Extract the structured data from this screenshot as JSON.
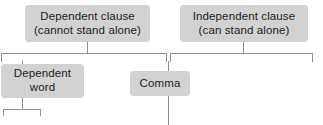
{
  "diagram": {
    "background_color": "#ffffff",
    "box_fill_color": "#d2d2d2",
    "text_color": "#1c1c1c",
    "connector_color": "#8f8f8f",
    "nodes": [
      {
        "id": "dependent-clause",
        "line1": "Dependent clause",
        "line2": "(cannot stand alone)"
      },
      {
        "id": "independent-clause",
        "line1": "Independent clause",
        "line2": "(can stand alone)"
      },
      {
        "id": "dependent-word",
        "line1": "Dependent",
        "line2": "word"
      },
      {
        "id": "comma",
        "line1": "Comma"
      }
    ]
  }
}
